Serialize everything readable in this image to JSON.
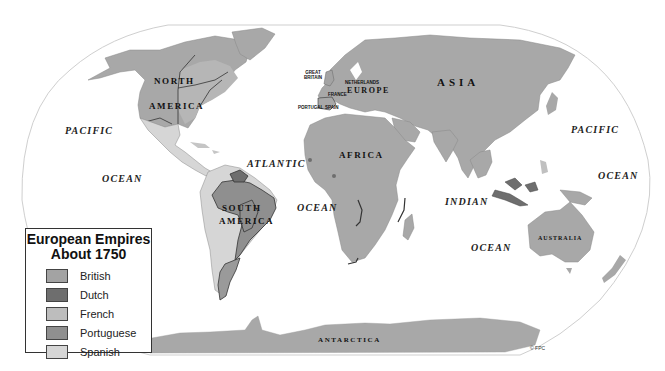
{
  "map": {
    "title": "European Empires About 1750",
    "oceans": [
      {
        "id": "pacific-west",
        "label": "PACIFIC",
        "x": 65,
        "y": 125
      },
      {
        "id": "ocean-west",
        "label": "OCEAN",
        "x": 102,
        "y": 173
      },
      {
        "id": "atlantic",
        "label": "ATLANTIC",
        "x": 247,
        "y": 158
      },
      {
        "id": "ocean-atlantic",
        "label": "OCEAN",
        "x": 298,
        "y": 204
      },
      {
        "id": "indian",
        "label": "INDIAN",
        "x": 445,
        "y": 196
      },
      {
        "id": "ocean-indian",
        "label": "OCEAN",
        "x": 471,
        "y": 242
      },
      {
        "id": "pacific-east",
        "label": "PACIFIC",
        "x": 571,
        "y": 124
      },
      {
        "id": "ocean-east",
        "label": "OCEAN",
        "x": 598,
        "y": 170
      }
    ],
    "continents": [
      {
        "id": "north",
        "label": "NORTH",
        "x": 154,
        "y": 78
      },
      {
        "id": "america-n",
        "label": "AMERICA",
        "x": 149,
        "y": 103
      },
      {
        "id": "south",
        "label": "SOUTH",
        "x": 222,
        "y": 204
      },
      {
        "id": "america-s",
        "label": "AMERICA",
        "x": 219,
        "y": 217
      },
      {
        "id": "europe",
        "label": "EUROPE",
        "x": 347,
        "y": 88
      },
      {
        "id": "asia",
        "label": "ASIA",
        "x": 437,
        "y": 79
      },
      {
        "id": "africa",
        "label": "AFRICA",
        "x": 339,
        "y": 152
      },
      {
        "id": "australia",
        "label": "AUSTRALIA",
        "x": 538,
        "y": 236
      },
      {
        "id": "antarctica",
        "label": "ANTARCTICA",
        "x": 318,
        "y": 337
      }
    ],
    "countries": [
      {
        "id": "great-britain",
        "label": "GREAT\nBRITAIN",
        "x": 305,
        "y": 72
      },
      {
        "id": "netherlands",
        "label": "NETHERLANDS",
        "x": 345,
        "y": 80
      },
      {
        "id": "france",
        "label": "FRANCE",
        "x": 328,
        "y": 92
      },
      {
        "id": "portugal",
        "label": "PORTUGAL",
        "x": 300,
        "y": 105
      },
      {
        "id": "spain",
        "label": "SPAIN",
        "x": 325,
        "y": 105
      }
    ],
    "copyright": "© FPC"
  },
  "legend": {
    "title_line1": "European Empires",
    "title_line2": "About 1750",
    "items": [
      {
        "label": "British",
        "color": "#a3a3a3"
      },
      {
        "label": "Dutch",
        "color": "#6e6e6e"
      },
      {
        "label": "French",
        "color": "#bdbdbd"
      },
      {
        "label": "Portuguese",
        "color": "#8f8f8f"
      },
      {
        "label": "Spanish",
        "color": "#d6d6d6"
      }
    ]
  },
  "colors": {
    "land": "#a8a8a8",
    "british": "#a3a3a3",
    "dutch": "#6e6e6e",
    "french": "#bdbdbd",
    "portuguese": "#8f8f8f",
    "spanish": "#d6d6d6",
    "border": "#333333",
    "graticule": "#cccccc"
  }
}
